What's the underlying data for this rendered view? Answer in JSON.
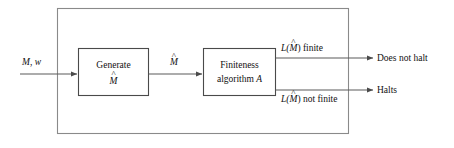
{
  "diagram": {
    "type": "flowchart",
    "colors": {
      "outer_border": "#8a8a8a",
      "inner_border": "#4a4a4a",
      "line": "#5a5a5a",
      "text": "#111111",
      "background": "#ffffff"
    },
    "input": {
      "label_machine": "M",
      "label_separator": ",",
      "label_string": "w",
      "label_full": "M, w"
    },
    "boxes": [
      {
        "id": "generate",
        "line1": "Generate",
        "line2_base": "M",
        "line2_accent": "^",
        "line2_full": "M̂"
      },
      {
        "id": "finiteness",
        "line1": "Finiteness",
        "line2_prefix": "algorithm",
        "line2_italic": "A",
        "line2_full": "algorithm A"
      }
    ],
    "intermediate": {
      "base": "M",
      "accent": "^",
      "full": "M̂"
    },
    "branches": [
      {
        "id": "finite",
        "condition_prefix": "L(",
        "condition_var": "M",
        "condition_accent": "^",
        "condition_suffix": ") finite",
        "condition_full": "L(M̂) finite",
        "outcome": "Does not halt"
      },
      {
        "id": "not-finite",
        "condition_prefix": "L(",
        "condition_var": "M",
        "condition_accent": "^",
        "condition_suffix": ") not finite",
        "condition_full": "L(M̂) not finite",
        "outcome": "Halts"
      }
    ]
  }
}
